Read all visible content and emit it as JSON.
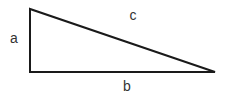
{
  "diagram": {
    "type": "right-triangle",
    "vertices": {
      "top_left": [
        30,
        9
      ],
      "bottom_left": [
        30,
        72
      ],
      "bottom_right": [
        215,
        72
      ]
    },
    "stroke_color": "#1a1a1a",
    "stroke_width": 2,
    "labels": {
      "a": {
        "text": "a",
        "x": 14,
        "y": 43,
        "side": "vertical leg"
      },
      "b": {
        "text": "b",
        "x": 127,
        "y": 91,
        "side": "horizontal leg"
      },
      "c": {
        "text": "c",
        "x": 133,
        "y": 20,
        "side": "hypotenuse"
      }
    }
  }
}
